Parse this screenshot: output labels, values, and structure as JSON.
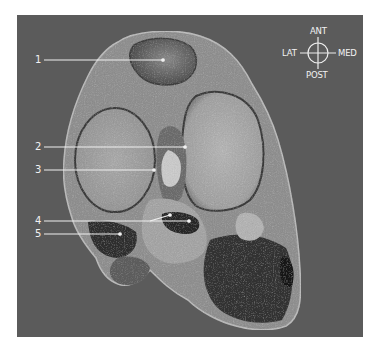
{
  "figure": {
    "background_color": "#5b5b5b",
    "frame": {
      "x": 17,
      "y": 15,
      "width": 346,
      "height": 322
    }
  },
  "compass": {
    "center": [
      318,
      53
    ],
    "radius": 10,
    "anterior": "ANT",
    "posterior": "POST",
    "lateral": "LAT",
    "medial": "MED"
  },
  "callouts": [
    {
      "number": "1",
      "label_pos": [
        35,
        55
      ],
      "line": [
        [
          44,
          60
        ],
        [
          163,
          60
        ]
      ]
    },
    {
      "number": "2",
      "label_pos": [
        35,
        142
      ],
      "line": [
        [
          44,
          147
        ],
        [
          185,
          147
        ]
      ]
    },
    {
      "number": "3",
      "label_pos": [
        35,
        165
      ],
      "line": [
        [
          44,
          170
        ],
        [
          154,
          170
        ]
      ]
    },
    {
      "number": "4",
      "label_pos": [
        35,
        216
      ],
      "line": [
        [
          44,
          221
        ],
        [
          150,
          221
        ]
      ],
      "branches": [
        [
          [
            150,
            221
          ],
          [
            170,
            215
          ]
        ],
        [
          [
            150,
            221
          ],
          [
            189,
            221
          ]
        ]
      ]
    },
    {
      "number": "5",
      "label_pos": [
        35,
        229
      ],
      "line": [
        [
          44,
          234
        ],
        [
          120,
          234
        ]
      ]
    }
  ]
}
